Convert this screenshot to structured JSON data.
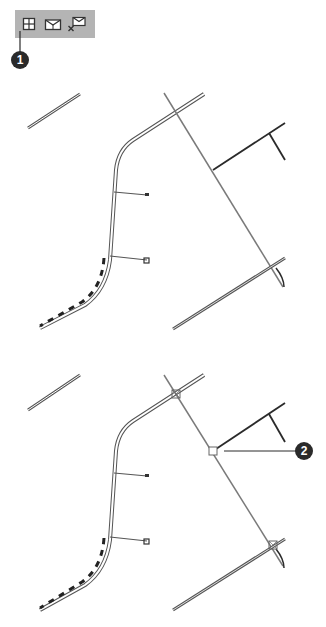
{
  "toolbar": {
    "buttons": [
      {
        "name": "snap-grid-icon",
        "tooltip": ""
      },
      {
        "name": "insert-node-icon",
        "tooltip": ""
      },
      {
        "name": "remove-node-icon",
        "tooltip": ""
      }
    ],
    "background": "#b4b4b4"
  },
  "callouts": [
    {
      "label": "1",
      "target": "snap-grid-button"
    },
    {
      "label": "2",
      "target": "intersection-node"
    }
  ],
  "panels": [
    {
      "name": "before",
      "nodes_visible": false
    },
    {
      "name": "after",
      "nodes_visible": true,
      "node_count": 3
    }
  ],
  "colors": {
    "line_dark": "#2a2a2a",
    "line_gray": "#808080",
    "callout_bg": "#2a2a2a"
  }
}
